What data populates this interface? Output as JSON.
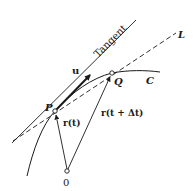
{
  "diagram": {
    "type": "vector-calculus-tangent",
    "labels": {
      "tangent": "Tangent",
      "secant_line": "L",
      "curve": "C",
      "unit_tangent": "u",
      "point_p": "P",
      "point_q": "Q",
      "origin": "0",
      "position_p": "r(t)",
      "position_q": "r(t + Δt)"
    },
    "colors": {
      "ink": "#1a1a1a",
      "background": "#ffffff"
    }
  }
}
